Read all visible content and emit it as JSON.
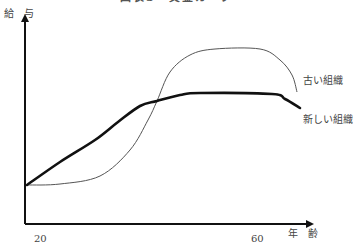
{
  "chart_data": {
    "type": "line",
    "title": "図表3　賃金カーブ",
    "xlabel": "年　齢",
    "ylabel": "給　与",
    "x_ticks": [
      "20",
      "60"
    ],
    "grid": false,
    "legend_position": "inline-right",
    "x": [
      20,
      25,
      30,
      35,
      40,
      45,
      50,
      55,
      60,
      63
    ],
    "series": [
      {
        "name": "古い組織",
        "style": "thin",
        "values": [
          0.2,
          0.21,
          0.25,
          0.4,
          0.78,
          0.96,
          1.0,
          1.0,
          0.97,
          0.73
        ],
        "path": [
          [
            27,
            185
          ],
          [
            60,
            184
          ],
          [
            100,
            176
          ],
          [
            130,
            150
          ],
          [
            148,
            120
          ],
          [
            157,
            101
          ],
          [
            170,
            72
          ],
          [
            190,
            55
          ],
          [
            215,
            49
          ],
          [
            260,
            49
          ],
          [
            280,
            60
          ],
          [
            292,
            75
          ],
          [
            297,
            92
          ]
        ]
      },
      {
        "name": "新しい組織",
        "style": "thick",
        "values": [
          0.2,
          0.38,
          0.56,
          0.72,
          0.8,
          0.83,
          0.83,
          0.82,
          0.81,
          0.73
        ],
        "path": [
          [
            27,
            185
          ],
          [
            60,
            162
          ],
          [
            95,
            140
          ],
          [
            118,
            122
          ],
          [
            140,
            106
          ],
          [
            157,
            101
          ],
          [
            180,
            95
          ],
          [
            200,
            93
          ],
          [
            272,
            94
          ],
          [
            285,
            99
          ],
          [
            300,
            108
          ]
        ]
      }
    ],
    "axis_pixels": {
      "origin": [
        25,
        224
      ],
      "y_top": 14,
      "x_right": 314
    }
  },
  "labels": {
    "title": "図表3　賃金カーブ",
    "ylabel": "給　与",
    "xlabel": "年　齢",
    "tick_20": "20",
    "tick_60": "60",
    "legend_old": "古い組織",
    "legend_new": "新しい組織"
  }
}
